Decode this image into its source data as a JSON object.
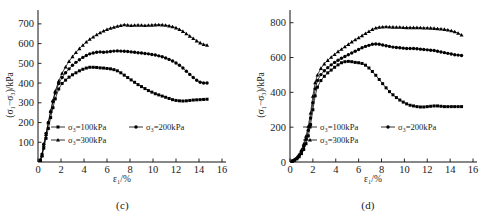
{
  "figure": {
    "panels": [
      {
        "id": "c",
        "caption": "(c)",
        "chart_data": {
          "type": "line",
          "title": "",
          "xlabel": "ε₁/%",
          "ylabel": "(σ₁−σ₃)/kPa",
          "xlim": [
            0,
            16
          ],
          "ylim": [
            0,
            750
          ],
          "xticks": [
            0,
            2,
            4,
            6,
            8,
            10,
            12,
            14,
            16
          ],
          "yticks": [
            100,
            200,
            300,
            400,
            500,
            600,
            700
          ],
          "grid": false,
          "legend_position": "inside-lower-left",
          "series": [
            {
              "name": "σ₃=100kPa",
              "marker": "square",
              "x": [
                0.2,
                0.35,
                0.5,
                0.7,
                0.9,
                1.1,
                1.3,
                1.5,
                1.8,
                2.1,
                2.4,
                2.7,
                3.0,
                3.3,
                3.6,
                3.9,
                4.2,
                4.5,
                4.8,
                5.1,
                5.4,
                5.7,
                6.0,
                6.3,
                6.6,
                6.9,
                7.2,
                7.5,
                7.8,
                8.1,
                8.4,
                8.7,
                9.0,
                9.3,
                9.6,
                9.9,
                10.2,
                10.5,
                10.8,
                11.1,
                11.4,
                11.7,
                12.0,
                12.3,
                12.6,
                12.9,
                13.2,
                13.5,
                13.8,
                14.1,
                14.4,
                14.7
              ],
              "y": [
                8,
                30,
                70,
                120,
                170,
                225,
                275,
                320,
                370,
                398,
                415,
                430,
                442,
                452,
                462,
                470,
                476,
                480,
                480,
                479,
                477,
                476,
                474,
                472,
                468,
                462,
                452,
                440,
                428,
                416,
                404,
                392,
                382,
                372,
                362,
                354,
                346,
                340,
                334,
                328,
                322,
                316,
                312,
                310,
                309,
                310,
                312,
                314,
                315,
                316,
                317,
                318
              ]
            },
            {
              "name": "σ₃=200kPa",
              "marker": "circle",
              "x": [
                0.2,
                0.35,
                0.5,
                0.7,
                0.9,
                1.1,
                1.3,
                1.5,
                1.8,
                2.1,
                2.4,
                2.7,
                3.0,
                3.3,
                3.6,
                3.9,
                4.2,
                4.5,
                4.8,
                5.1,
                5.4,
                5.7,
                6.0,
                6.3,
                6.6,
                6.9,
                7.2,
                7.5,
                7.8,
                8.1,
                8.4,
                8.7,
                9.0,
                9.3,
                9.6,
                9.9,
                10.2,
                10.5,
                10.8,
                11.1,
                11.4,
                11.7,
                12.0,
                12.3,
                12.6,
                12.9,
                13.2,
                13.5,
                13.8,
                14.1,
                14.4,
                14.7
              ],
              "y": [
                10,
                40,
                90,
                145,
                200,
                255,
                305,
                350,
                398,
                428,
                452,
                472,
                490,
                505,
                518,
                530,
                540,
                548,
                552,
                556,
                558,
                556,
                558,
                560,
                562,
                563,
                562,
                561,
                560,
                558,
                556,
                554,
                552,
                550,
                548,
                545,
                542,
                538,
                533,
                527,
                520,
                512,
                502,
                490,
                476,
                460,
                444,
                428,
                414,
                404,
                400,
                400
              ]
            },
            {
              "name": "σ₃=300kPa",
              "marker": "triangle",
              "x": [
                0.2,
                0.35,
                0.5,
                0.7,
                0.9,
                1.1,
                1.3,
                1.5,
                1.8,
                2.1,
                2.4,
                2.7,
                3.0,
                3.3,
                3.6,
                3.9,
                4.2,
                4.5,
                4.8,
                5.1,
                5.4,
                5.7,
                6.0,
                6.3,
                6.6,
                6.9,
                7.2,
                7.5,
                7.8,
                8.1,
                8.4,
                8.7,
                9.0,
                9.3,
                9.6,
                9.9,
                10.2,
                10.5,
                10.8,
                11.1,
                11.4,
                11.7,
                12.0,
                12.3,
                12.6,
                12.9,
                13.2,
                13.5,
                13.8,
                14.1,
                14.4,
                14.7
              ],
              "y": [
                8,
                35,
                85,
                140,
                200,
                258,
                312,
                360,
                410,
                450,
                482,
                510,
                534,
                555,
                575,
                592,
                608,
                622,
                634,
                645,
                655,
                664,
                672,
                678,
                683,
                688,
                692,
                696,
                694,
                692,
                693,
                694,
                693,
                692,
                693,
                694,
                695,
                696,
                695,
                693,
                690,
                686,
                680,
                672,
                662,
                650,
                638,
                626,
                614,
                604,
                596,
                592
              ]
            }
          ]
        }
      },
      {
        "id": "d",
        "caption": "(d)",
        "chart_data": {
          "type": "line",
          "title": "",
          "xlabel": "ε₁/%",
          "ylabel": "(σ₁−σ₃)/kPa",
          "xlim": [
            0,
            16
          ],
          "ylim": [
            0,
            850
          ],
          "xticks": [
            0,
            2,
            4,
            6,
            8,
            10,
            12,
            14,
            16
          ],
          "yticks": [
            0,
            200,
            400,
            600,
            800
          ],
          "grid": false,
          "legend_position": "inside-lower-left",
          "series": [
            {
              "name": "σ₃=100kPa",
              "marker": "square",
              "x": [
                0.2,
                0.4,
                0.6,
                0.8,
                1.0,
                1.2,
                1.4,
                1.6,
                1.8,
                2.0,
                2.2,
                2.4,
                2.7,
                3.0,
                3.3,
                3.6,
                3.9,
                4.2,
                4.5,
                4.8,
                5.1,
                5.4,
                5.7,
                6.0,
                6.3,
                6.6,
                6.9,
                7.2,
                7.5,
                7.8,
                8.1,
                8.4,
                8.7,
                9.0,
                9.3,
                9.6,
                9.9,
                10.2,
                10.5,
                10.8,
                11.1,
                11.4,
                11.7,
                12.0,
                12.3,
                12.6,
                12.9,
                13.2,
                13.5,
                13.8,
                14.1,
                14.4,
                14.7,
                15.0
              ],
              "y": [
                5,
                10,
                18,
                30,
                48,
                72,
                105,
                150,
                215,
                300,
                380,
                430,
                468,
                492,
                512,
                528,
                544,
                558,
                570,
                576,
                578,
                576,
                572,
                570,
                566,
                556,
                540,
                520,
                498,
                474,
                450,
                426,
                404,
                386,
                370,
                356,
                344,
                334,
                326,
                322,
                318,
                316,
                316,
                318,
                320,
                322,
                322,
                320,
                318,
                318,
                318,
                318,
                318,
                318
              ]
            },
            {
              "name": "σ₃=200kPa",
              "marker": "circle",
              "x": [
                0.2,
                0.4,
                0.6,
                0.8,
                1.0,
                1.2,
                1.4,
                1.6,
                1.8,
                2.0,
                2.2,
                2.4,
                2.7,
                3.0,
                3.3,
                3.6,
                3.9,
                4.2,
                4.5,
                4.8,
                5.1,
                5.4,
                5.7,
                6.0,
                6.3,
                6.6,
                6.9,
                7.2,
                7.5,
                7.8,
                8.1,
                8.4,
                8.7,
                9.0,
                9.3,
                9.6,
                9.9,
                10.2,
                10.5,
                10.8,
                11.1,
                11.4,
                11.7,
                12.0,
                12.3,
                12.6,
                12.9,
                13.2,
                13.5,
                13.8,
                14.1,
                14.4,
                14.7,
                15.0
              ],
              "y": [
                6,
                12,
                22,
                38,
                60,
                90,
                130,
                182,
                252,
                340,
                420,
                468,
                502,
                524,
                542,
                558,
                572,
                584,
                596,
                606,
                616,
                626,
                636,
                646,
                656,
                664,
                670,
                676,
                678,
                676,
                672,
                668,
                664,
                660,
                658,
                656,
                654,
                652,
                652,
                652,
                650,
                648,
                646,
                644,
                642,
                640,
                636,
                632,
                628,
                624,
                620,
                616,
                614,
                612
              ]
            },
            {
              "name": "σ₃=300kPa",
              "marker": "triangle",
              "x": [
                0.2,
                0.4,
                0.6,
                0.8,
                1.0,
                1.2,
                1.4,
                1.6,
                1.8,
                2.0,
                2.2,
                2.4,
                2.7,
                3.0,
                3.3,
                3.6,
                3.9,
                4.2,
                4.5,
                4.8,
                5.1,
                5.4,
                5.7,
                6.0,
                6.3,
                6.6,
                6.9,
                7.2,
                7.5,
                7.8,
                8.1,
                8.4,
                8.7,
                9.0,
                9.3,
                9.6,
                9.9,
                10.2,
                10.5,
                10.8,
                11.1,
                11.4,
                11.7,
                12.0,
                12.3,
                12.6,
                12.9,
                13.2,
                13.5,
                13.8,
                14.1,
                14.4,
                14.7,
                15.0
              ],
              "y": [
                6,
                14,
                26,
                44,
                70,
                104,
                148,
                206,
                282,
                378,
                456,
                500,
                538,
                564,
                584,
                602,
                618,
                634,
                648,
                662,
                676,
                690,
                702,
                714,
                726,
                738,
                750,
                762,
                770,
                774,
                776,
                777,
                776,
                775,
                774,
                774,
                773,
                772,
                772,
                772,
                772,
                771,
                770,
                770,
                769,
                768,
                766,
                764,
                762,
                758,
                754,
                748,
                740,
                730
              ]
            }
          ]
        }
      }
    ]
  }
}
